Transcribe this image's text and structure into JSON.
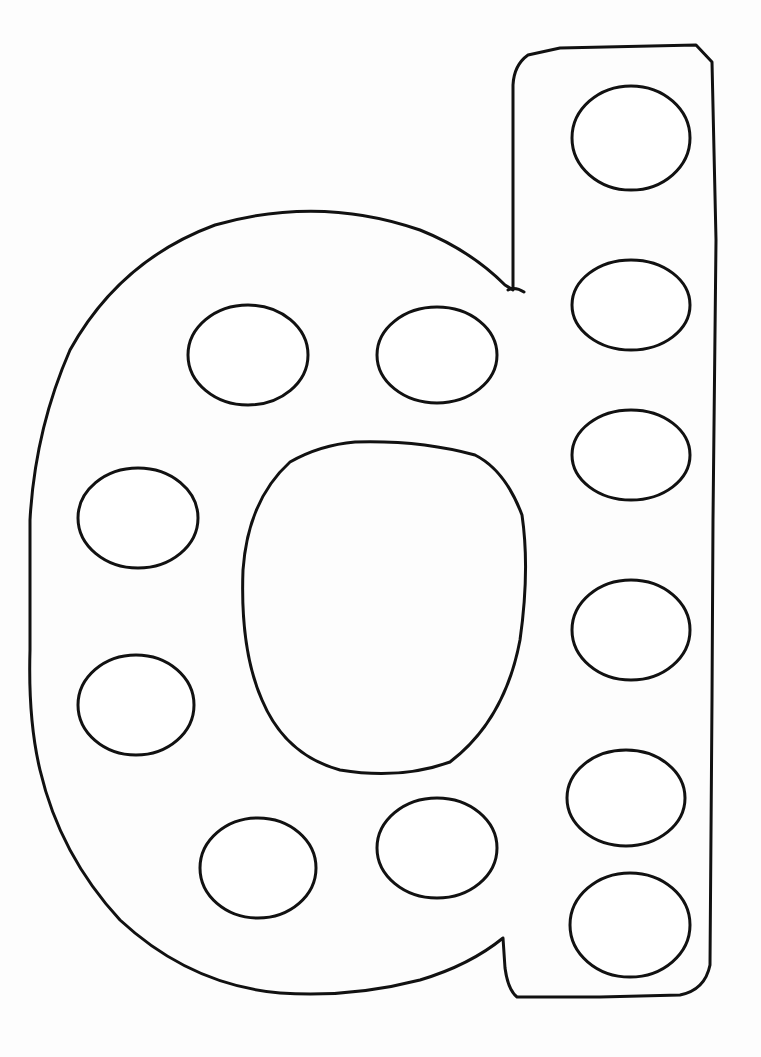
{
  "worksheet": {
    "letter": "d",
    "description": "Lowercase letter d dot-marker outline",
    "background_color": "#fdfdfd",
    "stroke_color": "#111111",
    "dots": [
      {
        "id": "stem-1",
        "cx": 631,
        "cy": 138,
        "rx": 59,
        "ry": 52
      },
      {
        "id": "stem-2",
        "cx": 631,
        "cy": 305,
        "rx": 59,
        "ry": 45
      },
      {
        "id": "stem-3",
        "cx": 631,
        "cy": 455,
        "rx": 59,
        "ry": 45
      },
      {
        "id": "stem-4",
        "cx": 631,
        "cy": 630,
        "rx": 59,
        "ry": 50
      },
      {
        "id": "stem-5",
        "cx": 626,
        "cy": 798,
        "rx": 59,
        "ry": 48
      },
      {
        "id": "stem-6",
        "cx": 630,
        "cy": 925,
        "rx": 60,
        "ry": 52
      },
      {
        "id": "bowl-top-left",
        "cx": 248,
        "cy": 355,
        "rx": 60,
        "ry": 50
      },
      {
        "id": "bowl-top-right",
        "cx": 437,
        "cy": 355,
        "rx": 60,
        "ry": 48
      },
      {
        "id": "bowl-left-upper",
        "cx": 138,
        "cy": 518,
        "rx": 60,
        "ry": 50
      },
      {
        "id": "bowl-left-lower",
        "cx": 136,
        "cy": 705,
        "rx": 58,
        "ry": 50
      },
      {
        "id": "bowl-bottom-left",
        "cx": 258,
        "cy": 868,
        "rx": 58,
        "ry": 50
      },
      {
        "id": "bowl-bottom-right",
        "cx": 437,
        "cy": 848,
        "rx": 60,
        "ry": 50
      }
    ]
  }
}
